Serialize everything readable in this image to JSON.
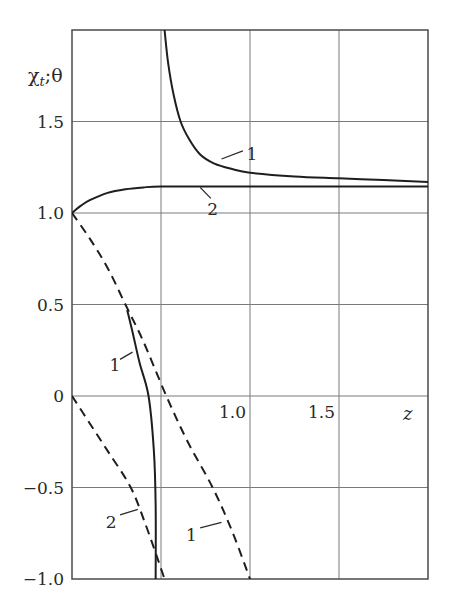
{
  "chart_data": {
    "type": "line",
    "title": "",
    "xlabel": "z",
    "ylabel": "χt; θ",
    "xlim": [
      0,
      2.0
    ],
    "ylim": [
      -1.0,
      2.0
    ],
    "grid": true,
    "legend": "none (curves labeled inline with numbers 1 and 2)",
    "x_ticks": [
      {
        "value": 1.0,
        "label": "1.0"
      },
      {
        "value": 1.5,
        "label": "1.5"
      }
    ],
    "x_gridlines": [
      0.5,
      1.0,
      1.5
    ],
    "y_ticks": [
      {
        "value": 1.5,
        "label": "1.5"
      },
      {
        "value": 1.0,
        "label": "1.0"
      },
      {
        "value": 0.5,
        "label": "0.5"
      },
      {
        "value": 0,
        "label": "0"
      },
      {
        "value": -0.5,
        "label": "−0.5"
      },
      {
        "value": -1.0,
        "label": "−1.0"
      }
    ],
    "series": [
      {
        "name": "1",
        "style": "solid",
        "branch": "upper (χt)",
        "x": [
          0.52,
          0.54,
          0.57,
          0.61,
          0.66,
          0.72,
          0.8,
          0.9,
          1.0,
          1.25,
          1.5,
          1.75,
          2.0
        ],
        "y": [
          2.0,
          1.82,
          1.65,
          1.5,
          1.4,
          1.32,
          1.27,
          1.24,
          1.22,
          1.2,
          1.19,
          1.18,
          1.17
        ]
      },
      {
        "name": "2",
        "style": "solid",
        "branch": "upper (χt)",
        "x": [
          0,
          0.05,
          0.1,
          0.2,
          0.3,
          0.4,
          0.5,
          0.75,
          1.0,
          1.5,
          2.0
        ],
        "y": [
          1.0,
          1.04,
          1.07,
          1.11,
          1.13,
          1.14,
          1.145,
          1.145,
          1.145,
          1.145,
          1.145
        ]
      },
      {
        "name": "1",
        "style": "solid",
        "branch": "lower (θ)",
        "x": [
          0.31,
          0.34,
          0.38,
          0.43,
          0.46,
          0.47,
          0.47
        ],
        "y": [
          0.47,
          0.35,
          0.18,
          0.0,
          -0.3,
          -0.6,
          -1.0
        ]
      },
      {
        "name": "1",
        "style": "dashed",
        "branch": "θ",
        "x": [
          0,
          0.1,
          0.2,
          0.3,
          0.4,
          0.53,
          0.65,
          0.79,
          0.9,
          1.0
        ],
        "y": [
          1.0,
          0.86,
          0.7,
          0.5,
          0.3,
          0.0,
          -0.25,
          -0.5,
          -0.74,
          -1.0
        ]
      },
      {
        "name": "2",
        "style": "dashed",
        "branch": "θ",
        "x": [
          0,
          0.1,
          0.2,
          0.33,
          0.42,
          0.52
        ],
        "y": [
          0.0,
          -0.15,
          -0.3,
          -0.5,
          -0.72,
          -1.0
        ]
      }
    ],
    "annotations": [
      {
        "text": "1",
        "target": "solid upper curve 1",
        "x": 0.9,
        "y": 1.35
      },
      {
        "text": "2",
        "target": "solid curve 2",
        "x": 0.8,
        "y": 1.05
      },
      {
        "text": "1",
        "target": "solid lower curve 1",
        "x": 0.23,
        "y": 0.18
      },
      {
        "text": "2",
        "target": "dashed curve 2",
        "x": 0.22,
        "y": -0.67
      },
      {
        "text": "1",
        "target": "dashed curve 1",
        "x": 0.68,
        "y": -0.72
      }
    ]
  },
  "labels": {
    "ylabel_main": "χ",
    "ylabel_sub": "t",
    "ylabel_rest": ";θ",
    "xlabel": "z",
    "curve_1": "1",
    "curve_2": "2"
  }
}
